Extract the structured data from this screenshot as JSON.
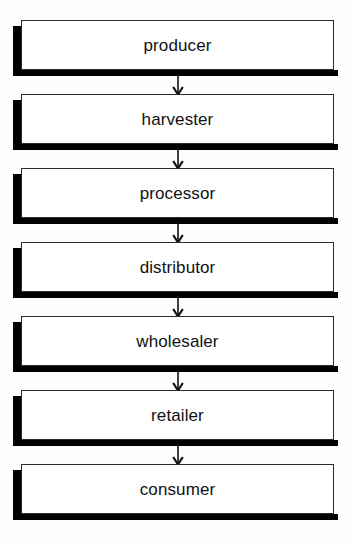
{
  "diagram": {
    "type": "vertical-flow-chart",
    "background_color": "#fdfdfd",
    "box_fill_color": "#ffffff",
    "box_border_color": "#2b2b2b",
    "shadow_color": "#000000",
    "text_color": "#111111",
    "arrow_color": "#111111",
    "stage_count": 7,
    "stages": [
      {
        "label": "producer"
      },
      {
        "label": "harvester"
      },
      {
        "label": "processor"
      },
      {
        "label": "distributor"
      },
      {
        "label": "wholesaler"
      },
      {
        "label": "retailer"
      },
      {
        "label": "consumer"
      }
    ],
    "connectors": [
      {
        "from": "producer",
        "to": "harvester",
        "glyph": "down-arrow"
      },
      {
        "from": "harvester",
        "to": "processor",
        "glyph": "down-arrow"
      },
      {
        "from": "processor",
        "to": "distributor",
        "glyph": "down-arrow"
      },
      {
        "from": "distributor",
        "to": "wholesaler",
        "glyph": "down-arrow"
      },
      {
        "from": "wholesaler",
        "to": "retailer",
        "glyph": "down-arrow"
      },
      {
        "from": "retailer",
        "to": "consumer",
        "glyph": "down-arrow"
      }
    ]
  }
}
